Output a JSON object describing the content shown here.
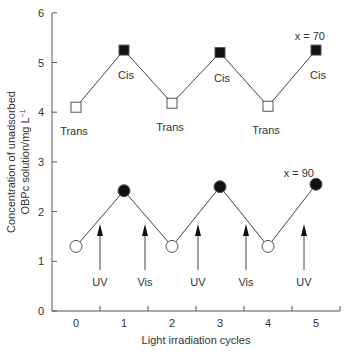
{
  "chart_data": {
    "type": "line",
    "title": "",
    "xlabel": "Light irradiation cycles",
    "ylabel_line1": "Concentration of unadsorbed",
    "ylabel_line2": "OBPc solution/mg L",
    "ylabel_sup": "−1",
    "x": [
      0,
      1,
      2,
      3,
      4,
      5
    ],
    "x_ticks": [
      "0",
      "1",
      "2",
      "3",
      "4",
      "5"
    ],
    "y_ticks": [
      "0",
      "1",
      "2",
      "3",
      "4",
      "5",
      "6"
    ],
    "xlim": [
      -0.5,
      5.5
    ],
    "ylim": [
      0,
      6
    ],
    "grid": false,
    "series": [
      {
        "name": "x = 70",
        "marker": "square",
        "values": [
          4.1,
          5.25,
          4.18,
          5.2,
          4.12,
          5.25
        ],
        "point_labels": [
          "Trans",
          "Cis",
          "Trans",
          "Cis",
          "Trans",
          "Cis"
        ]
      },
      {
        "name": "x = 90",
        "marker": "circle",
        "values": [
          1.3,
          2.42,
          1.3,
          2.5,
          1.3,
          2.55
        ]
      }
    ],
    "annotations": [
      {
        "text": "UV",
        "x": 0.5
      },
      {
        "text": "Vis",
        "x": 1.5
      },
      {
        "text": "UV",
        "x": 2.5
      },
      {
        "text": "Vis",
        "x": 3.5
      },
      {
        "text": "UV",
        "x": 4.5
      }
    ],
    "series_labels": {
      "upper": "x = 70",
      "lower": "x = 90"
    }
  }
}
